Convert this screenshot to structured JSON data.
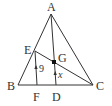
{
  "diagram": {
    "type": "geometry-triangle",
    "stroke_color": "#333333",
    "points": {
      "A": {
        "label": "A",
        "x": 51,
        "y": 14
      },
      "B": {
        "label": "B",
        "x": 18,
        "y": 85
      },
      "C": {
        "label": "C",
        "x": 93,
        "y": 85
      },
      "D": {
        "label": "D",
        "x": 56,
        "y": 85
      },
      "E": {
        "label": "E",
        "x": 35,
        "y": 51
      },
      "F": {
        "label": "F",
        "x": 37,
        "y": 85
      },
      "G": {
        "label": "G",
        "x": 54,
        "y": 62
      }
    },
    "segments": [
      {
        "from": "A",
        "to": "B"
      },
      {
        "from": "A",
        "to": "C"
      },
      {
        "from": "B",
        "to": "C"
      },
      {
        "from": "A",
        "to": "D"
      },
      {
        "from": "E",
        "to": "C"
      },
      {
        "from": "E",
        "to": "F"
      }
    ],
    "measurements": {
      "EF": "9",
      "GD": "x"
    },
    "parallel_marks": [
      "EF",
      "GD"
    ]
  }
}
